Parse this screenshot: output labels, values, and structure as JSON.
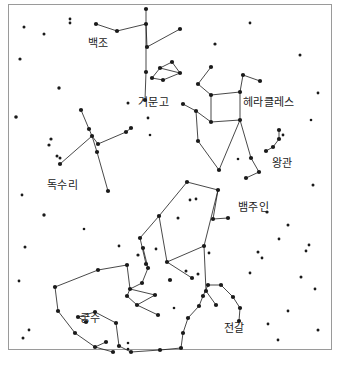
{
  "chart": {
    "type": "constellation-map",
    "width": 340,
    "height": 365,
    "background_color": "#ffffff",
    "star_color": "#1a1a1a",
    "line_color": "#1a1a1a",
    "border_color": "#9a9a9a",
    "label_color": "#1a1a1a"
  },
  "constellations": [
    {
      "id": "cygnus",
      "label": "백조",
      "label_x": 88,
      "label_y": 38,
      "stars": [
        [
          96,
          24
        ],
        [
          117,
          31
        ],
        [
          146,
          24
        ],
        [
          146,
          9
        ],
        [
          147,
          47
        ],
        [
          180,
          29
        ],
        [
          146,
          72
        ],
        [
          145,
          100
        ]
      ],
      "lines": [
        [
          [
            96,
            24
          ],
          [
            117,
            31
          ]
        ],
        [
          [
            117,
            31
          ],
          [
            146,
            24
          ]
        ],
        [
          [
            146,
            24
          ],
          [
            146,
            9
          ]
        ],
        [
          [
            146,
            24
          ],
          [
            147,
            47
          ]
        ],
        [
          [
            147,
            47
          ],
          [
            180,
            29
          ]
        ],
        [
          [
            146,
            24
          ],
          [
            146,
            72
          ]
        ],
        [
          [
            146,
            72
          ],
          [
            145,
            100
          ]
        ]
      ]
    },
    {
      "id": "lyra",
      "label": "거문고",
      "label_x": 138,
      "label_y": 97,
      "stars": [
        [
          152,
          78
        ],
        [
          160,
          68
        ],
        [
          172,
          62
        ],
        [
          180,
          73
        ],
        [
          163,
          80
        ]
      ],
      "lines": [
        [
          [
            152,
            78
          ],
          [
            160,
            68
          ]
        ],
        [
          [
            160,
            68
          ],
          [
            172,
            62
          ]
        ],
        [
          [
            172,
            62
          ],
          [
            180,
            73
          ]
        ],
        [
          [
            180,
            73
          ],
          [
            163,
            80
          ]
        ],
        [
          [
            163,
            80
          ],
          [
            152,
            78
          ]
        ],
        [
          [
            160,
            68
          ],
          [
            180,
            73
          ]
        ]
      ]
    },
    {
      "id": "hercules",
      "label": "헤라클레스",
      "label_x": 243,
      "label_y": 97,
      "stars": [
        [
          211,
          67
        ],
        [
          198,
          84
        ],
        [
          211,
          95
        ],
        [
          240,
          92
        ],
        [
          243,
          75
        ],
        [
          260,
          81
        ],
        [
          240,
          120
        ],
        [
          211,
          122
        ],
        [
          196,
          111
        ],
        [
          183,
          104
        ],
        [
          198,
          141
        ],
        [
          219,
          170
        ],
        [
          251,
          158
        ],
        [
          259,
          172
        ],
        [
          246,
          178
        ]
      ],
      "lines": [
        [
          [
            211,
            67
          ],
          [
            198,
            84
          ]
        ],
        [
          [
            198,
            84
          ],
          [
            211,
            95
          ]
        ],
        [
          [
            211,
            95
          ],
          [
            240,
            92
          ]
        ],
        [
          [
            240,
            92
          ],
          [
            243,
            75
          ]
        ],
        [
          [
            243,
            75
          ],
          [
            260,
            81
          ]
        ],
        [
          [
            240,
            92
          ],
          [
            240,
            120
          ]
        ],
        [
          [
            240,
            120
          ],
          [
            211,
            122
          ]
        ],
        [
          [
            211,
            122
          ],
          [
            211,
            95
          ]
        ],
        [
          [
            211,
            122
          ],
          [
            196,
            111
          ]
        ],
        [
          [
            196,
            111
          ],
          [
            183,
            104
          ]
        ],
        [
          [
            196,
            111
          ],
          [
            198,
            141
          ]
        ],
        [
          [
            198,
            141
          ],
          [
            219,
            170
          ]
        ],
        [
          [
            240,
            120
          ],
          [
            219,
            170
          ]
        ],
        [
          [
            240,
            120
          ],
          [
            251,
            158
          ]
        ],
        [
          [
            251,
            158
          ],
          [
            259,
            172
          ]
        ],
        [
          [
            259,
            172
          ],
          [
            246,
            178
          ]
        ]
      ]
    },
    {
      "id": "corona-borealis",
      "label": "왕관",
      "label_x": 272,
      "label_y": 158,
      "stars": [
        [
          266,
          151
        ],
        [
          273,
          147
        ],
        [
          279,
          139
        ],
        [
          279,
          130
        ]
      ],
      "lines": [
        [
          [
            266,
            151
          ],
          [
            273,
            147
          ]
        ],
        [
          [
            273,
            147
          ],
          [
            279,
            139
          ]
        ],
        [
          [
            279,
            139
          ],
          [
            279,
            130
          ]
        ]
      ]
    },
    {
      "id": "aquila",
      "label": "독수리",
      "label_x": 47,
      "label_y": 180,
      "stars": [
        [
          81,
          110
        ],
        [
          89,
          129
        ],
        [
          92,
          136
        ],
        [
          98,
          144
        ],
        [
          126,
          132
        ],
        [
          131,
          128
        ],
        [
          60,
          164
        ],
        [
          97,
          152
        ],
        [
          108,
          191
        ]
      ],
      "lines": [
        [
          [
            81,
            110
          ],
          [
            89,
            129
          ]
        ],
        [
          [
            89,
            129
          ],
          [
            92,
            136
          ]
        ],
        [
          [
            92,
            136
          ],
          [
            98,
            144
          ]
        ],
        [
          [
            98,
            144
          ],
          [
            126,
            132
          ]
        ],
        [
          [
            126,
            132
          ],
          [
            131,
            128
          ]
        ],
        [
          [
            92,
            136
          ],
          [
            60,
            164
          ]
        ],
        [
          [
            92,
            136
          ],
          [
            97,
            152
          ]
        ],
        [
          [
            97,
            152
          ],
          [
            108,
            191
          ]
        ]
      ]
    },
    {
      "id": "ophiuchus",
      "label": "뱀주인",
      "label_x": 238,
      "label_y": 202,
      "stars": [
        [
          187,
          182
        ],
        [
          159,
          216
        ],
        [
          167,
          262
        ],
        [
          204,
          246
        ],
        [
          218,
          190
        ],
        [
          213,
          219
        ],
        [
          228,
          218
        ],
        [
          140,
          238
        ],
        [
          146,
          264
        ],
        [
          170,
          280
        ],
        [
          192,
          278
        ],
        [
          206,
          291
        ],
        [
          216,
          305
        ]
      ],
      "lines": [
        [
          [
            187,
            182
          ],
          [
            159,
            216
          ]
        ],
        [
          [
            159,
            216
          ],
          [
            167,
            262
          ]
        ],
        [
          [
            167,
            262
          ],
          [
            204,
            246
          ]
        ],
        [
          [
            204,
            246
          ],
          [
            218,
            190
          ]
        ],
        [
          [
            218,
            190
          ],
          [
            187,
            182
          ]
        ],
        [
          [
            218,
            190
          ],
          [
            213,
            219
          ]
        ],
        [
          [
            213,
            219
          ],
          [
            228,
            218
          ]
        ],
        [
          [
            159,
            216
          ],
          [
            140,
            238
          ]
        ],
        [
          [
            140,
            238
          ],
          [
            146,
            264
          ]
        ],
        [
          [
            167,
            262
          ],
          [
            192,
            278
          ]
        ],
        [
          [
            204,
            246
          ],
          [
            206,
            291
          ]
        ],
        [
          [
            206,
            291
          ],
          [
            216,
            305
          ]
        ]
      ]
    },
    {
      "id": "sagittarius",
      "label": "궁수",
      "label_x": 80,
      "label_y": 313,
      "stars": [
        [
          98,
          270
        ],
        [
          127,
          265
        ],
        [
          55,
          287
        ],
        [
          58,
          311
        ],
        [
          75,
          333
        ],
        [
          95,
          347
        ],
        [
          106,
          342
        ],
        [
          113,
          352
        ],
        [
          127,
          296
        ],
        [
          142,
          283
        ],
        [
          148,
          268
        ],
        [
          130,
          289
        ],
        [
          155,
          295
        ],
        [
          137,
          305
        ],
        [
          158,
          315
        ],
        [
          143,
          248
        ]
      ],
      "lines": [
        [
          [
            98,
            270
          ],
          [
            127,
            265
          ]
        ],
        [
          [
            98,
            270
          ],
          [
            55,
            287
          ]
        ],
        [
          [
            55,
            287
          ],
          [
            58,
            311
          ]
        ],
        [
          [
            58,
            311
          ],
          [
            75,
            333
          ]
        ],
        [
          [
            75,
            333
          ],
          [
            95,
            347
          ]
        ],
        [
          [
            95,
            347
          ],
          [
            106,
            342
          ]
        ],
        [
          [
            95,
            347
          ],
          [
            113,
            352
          ]
        ],
        [
          [
            127,
            265
          ],
          [
            130,
            289
          ]
        ],
        [
          [
            130,
            289
          ],
          [
            127,
            296
          ]
        ],
        [
          [
            127,
            296
          ],
          [
            137,
            305
          ]
        ],
        [
          [
            137,
            305
          ],
          [
            158,
            315
          ]
        ],
        [
          [
            130,
            289
          ],
          [
            142,
            283
          ]
        ],
        [
          [
            142,
            283
          ],
          [
            148,
            268
          ]
        ],
        [
          [
            148,
            268
          ],
          [
            143,
            248
          ]
        ],
        [
          [
            130,
            289
          ],
          [
            155,
            295
          ]
        ],
        [
          [
            155,
            295
          ],
          [
            137,
            305
          ]
        ]
      ]
    },
    {
      "id": "scorpius",
      "label": "전갈",
      "label_x": 224,
      "label_y": 323,
      "stars": [
        [
          203,
          296
        ],
        [
          199,
          306
        ],
        [
          188,
          318
        ],
        [
          183,
          333
        ],
        [
          181,
          348
        ],
        [
          160,
          350
        ],
        [
          131,
          352
        ],
        [
          119,
          346
        ],
        [
          116,
          323
        ],
        [
          95,
          312
        ],
        [
          78,
          317
        ],
        [
          86,
          322
        ],
        [
          208,
          285
        ],
        [
          221,
          285
        ],
        [
          233,
          297
        ],
        [
          240,
          308
        ],
        [
          239,
          321
        ]
      ],
      "lines": [
        [
          [
            203,
            296
          ],
          [
            199,
            306
          ]
        ],
        [
          [
            199,
            306
          ],
          [
            188,
            318
          ]
        ],
        [
          [
            188,
            318
          ],
          [
            183,
            333
          ]
        ],
        [
          [
            183,
            333
          ],
          [
            181,
            348
          ]
        ],
        [
          [
            181,
            348
          ],
          [
            160,
            350
          ]
        ],
        [
          [
            160,
            350
          ],
          [
            131,
            352
          ]
        ],
        [
          [
            131,
            352
          ],
          [
            119,
            346
          ]
        ],
        [
          [
            119,
            346
          ],
          [
            116,
            323
          ]
        ],
        [
          [
            116,
            323
          ],
          [
            95,
            312
          ]
        ],
        [
          [
            95,
            312
          ],
          [
            78,
            317
          ]
        ],
        [
          [
            78,
            317
          ],
          [
            86,
            322
          ]
        ],
        [
          [
            203,
            296
          ],
          [
            208,
            285
          ]
        ],
        [
          [
            208,
            285
          ],
          [
            221,
            285
          ]
        ],
        [
          [
            221,
            285
          ],
          [
            233,
            297
          ]
        ],
        [
          [
            233,
            297
          ],
          [
            240,
            308
          ]
        ],
        [
          [
            240,
            308
          ],
          [
            239,
            321
          ]
        ]
      ]
    }
  ],
  "field_stars": [
    [
      24,
      27,
      1.5
    ],
    [
      44,
      34,
      1.5
    ],
    [
      70,
      19,
      1.4
    ],
    [
      70,
      23,
      1.4
    ],
    [
      20,
      59,
      1.6
    ],
    [
      59,
      88,
      1.7
    ],
    [
      16,
      117,
      1.8
    ],
    [
      51,
      139,
      1.6
    ],
    [
      49,
      145,
      1.6
    ],
    [
      57,
      156,
      1.5
    ],
    [
      60,
      158,
      1.5
    ],
    [
      22,
      195,
      1.4
    ],
    [
      44,
      215,
      1.7
    ],
    [
      25,
      247,
      1.5
    ],
    [
      19,
      281,
      1.4
    ],
    [
      23,
      338,
      1.5
    ],
    [
      128,
      103,
      1.5
    ],
    [
      148,
      118,
      1.4
    ],
    [
      150,
      135,
      1.3
    ],
    [
      119,
      246,
      1.4
    ],
    [
      138,
      255,
      1.6
    ],
    [
      156,
      249,
      1.4
    ],
    [
      190,
      200,
      1.4
    ],
    [
      196,
      199,
      1.4
    ],
    [
      178,
      218,
      1.5
    ],
    [
      209,
      253,
      1.4
    ],
    [
      186,
      271,
      1.5
    ],
    [
      198,
      274,
      1.5
    ],
    [
      215,
      44,
      1.6
    ],
    [
      250,
      23,
      1.4
    ],
    [
      283,
      135,
      1.4
    ],
    [
      300,
      55,
      1.5
    ],
    [
      318,
      93,
      1.4
    ],
    [
      311,
      120,
      1.3
    ],
    [
      267,
      212,
      1.6
    ],
    [
      288,
      225,
      1.5
    ],
    [
      279,
      239,
      1.4
    ],
    [
      258,
      252,
      1.5
    ],
    [
      262,
      258,
      1.4
    ],
    [
      313,
      185,
      1.5
    ],
    [
      309,
      245,
      1.4
    ],
    [
      306,
      251,
      1.4
    ],
    [
      301,
      277,
      1.5
    ],
    [
      315,
      289,
      1.4
    ],
    [
      288,
      311,
      1.4
    ],
    [
      268,
      324,
      1.4
    ],
    [
      318,
      330,
      1.5
    ],
    [
      278,
      340,
      1.4
    ],
    [
      128,
      343,
      1.3
    ],
    [
      128,
      349,
      1.3
    ],
    [
      250,
      273,
      1.4
    ],
    [
      238,
      159,
      1.3
    ],
    [
      29,
      330,
      1.4
    ],
    [
      174,
      308,
      1.3
    ],
    [
      84,
      229,
      1.3
    ]
  ]
}
